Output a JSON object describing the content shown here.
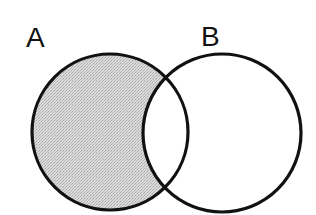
{
  "diagram": {
    "type": "venn",
    "sets": [
      {
        "id": "A",
        "label": "A",
        "shaded": true
      },
      {
        "id": "B",
        "label": "B",
        "shaded": false
      }
    ],
    "shaded_region": "A only (A minus B)",
    "colors": {
      "outline": "#111111",
      "shade": "#d2d2d2",
      "background": "#ffffff"
    }
  }
}
